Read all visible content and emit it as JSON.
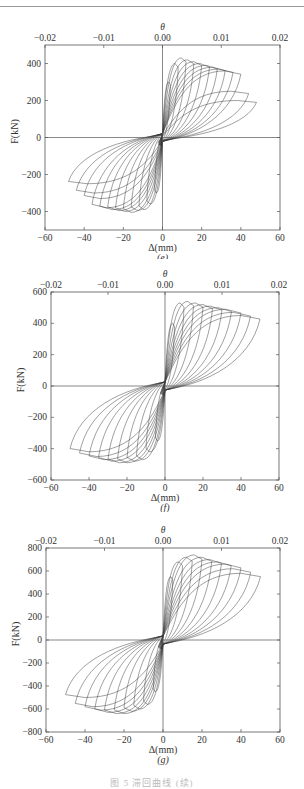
{
  "figure": {
    "caption": "图 5  滞回曲线 (续)"
  },
  "chart_data": [
    {
      "type": "line",
      "panel_label": "(e)",
      "title": "",
      "xlabel": "Δ(mm)",
      "ylabel": "F(kN)",
      "x2label": "θ",
      "xlim": [
        -60,
        60
      ],
      "ylim": [
        -500,
        500
      ],
      "x2lim": [
        -0.02,
        0.02
      ],
      "xticks": [
        "-60",
        "-40",
        "-20",
        "0",
        "20",
        "40",
        "60"
      ],
      "yticks": [
        "-400",
        "-200",
        "0",
        "200",
        "400"
      ],
      "x2ticks": [
        "-0.02",
        "-0.01",
        "0.00",
        "0.01",
        "0.02"
      ],
      "grid": false,
      "series": [
        {
          "name": "hysteresis loops",
          "pos_peak_disp": [
            4,
            8,
            12,
            16,
            20,
            24,
            28,
            32,
            36,
            40,
            44,
            48
          ],
          "pos_peak_force": [
            300,
            400,
            430,
            420,
            410,
            400,
            390,
            380,
            370,
            360,
            250,
            200
          ],
          "neg_peak_disp": [
            -4,
            -8,
            -12,
            -16,
            -20,
            -24,
            -28,
            -32,
            -36,
            -40,
            -44,
            -48
          ],
          "neg_peak_force": [
            -300,
            -360,
            -390,
            -395,
            -405,
            -400,
            -395,
            -390,
            -380,
            -330,
            -300,
            -250
          ]
        }
      ]
    },
    {
      "type": "line",
      "panel_label": "(f)",
      "title": "",
      "xlabel": "Δ(mm)",
      "ylabel": "F(kN)",
      "x2label": "θ",
      "xlim": [
        -60,
        60
      ],
      "ylim": [
        -600,
        600
      ],
      "x2lim": [
        -0.02,
        0.02
      ],
      "xticks": [
        "-60",
        "-40",
        "-20",
        "0",
        "20",
        "40",
        "60"
      ],
      "yticks": [
        "-600",
        "-400",
        "-200",
        "0",
        "200",
        "400",
        "600"
      ],
      "x2ticks": [
        "-0.02",
        "-0.01",
        "0.00",
        "0.01",
        "0.02"
      ],
      "grid": false,
      "series": [
        {
          "name": "hysteresis loops",
          "pos_peak_disp": [
            5,
            10,
            15,
            20,
            25,
            30,
            35,
            40,
            45,
            50
          ],
          "pos_peak_force": [
            400,
            530,
            540,
            530,
            520,
            510,
            500,
            490,
            470,
            450
          ],
          "neg_peak_disp": [
            -5,
            -10,
            -15,
            -20,
            -25,
            -30,
            -35,
            -40,
            -45,
            -50
          ],
          "neg_peak_force": [
            -350,
            -420,
            -470,
            -480,
            -490,
            -490,
            -480,
            -470,
            -450,
            -420
          ]
        }
      ]
    },
    {
      "type": "line",
      "panel_label": "(g)",
      "title": "",
      "xlabel": "Δ(mm)",
      "ylabel": "F(kN)",
      "x2label": "θ",
      "xlim": [
        -60,
        60
      ],
      "ylim": [
        -800,
        800
      ],
      "x2lim": [
        -0.02,
        0.02
      ],
      "xticks": [
        "-60",
        "-40",
        "-20",
        "0",
        "20",
        "40",
        "60"
      ],
      "yticks": [
        "-800",
        "-600",
        "-400",
        "-200",
        "0",
        "200",
        "400",
        "600",
        "800"
      ],
      "x2ticks": [
        "-0.02",
        "-0.01",
        "0.00",
        "0.01",
        "0.02"
      ],
      "grid": false,
      "series": [
        {
          "name": "hysteresis loops",
          "pos_peak_disp": [
            5,
            10,
            15,
            20,
            25,
            30,
            35,
            40,
            45,
            50
          ],
          "pos_peak_force": [
            550,
            680,
            720,
            740,
            720,
            700,
            680,
            660,
            620,
            580
          ],
          "neg_peak_disp": [
            -5,
            -10,
            -15,
            -20,
            -25,
            -30,
            -35,
            -40,
            -45,
            -50
          ],
          "neg_peak_force": [
            -450,
            -560,
            -600,
            -620,
            -640,
            -640,
            -630,
            -610,
            -580,
            -500
          ]
        }
      ]
    }
  ]
}
